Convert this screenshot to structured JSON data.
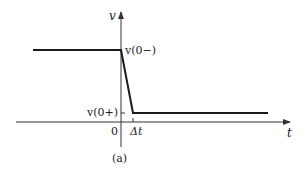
{
  "figure": {
    "caption": "(a)",
    "colors": {
      "line": "#1a1a1a",
      "axis": "#333333",
      "text": "#222222",
      "background": "#ffffff"
    }
  },
  "axes": {
    "y_label": "v",
    "x_label": "t",
    "origin_label": "0",
    "delta_label": "Δt"
  },
  "annotations": {
    "v_before": "v(0−)",
    "v_after": "v(0+)"
  },
  "waveform": {
    "description": "Voltage held constant at v(0−) for t<0, drops linearly to v(0+) over interval Δt, then remains constant",
    "points": [
      {
        "t": "-∞",
        "v": "v(0−)"
      },
      {
        "t": "0",
        "v": "v(0−)"
      },
      {
        "t": "Δt",
        "v": "v(0+)"
      },
      {
        "t": "+∞",
        "v": "v(0+)"
      }
    ]
  }
}
